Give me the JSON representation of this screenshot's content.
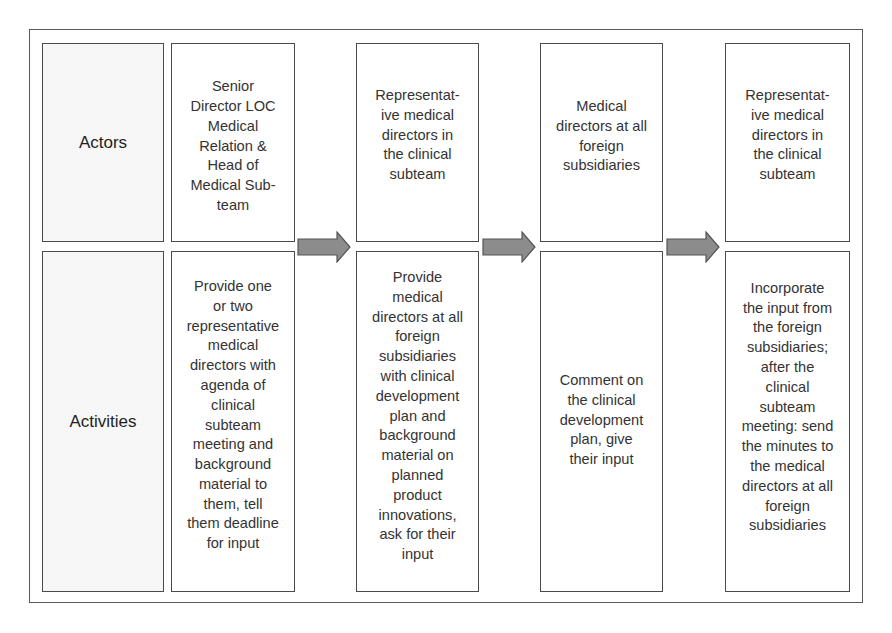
{
  "diagram": {
    "rows": {
      "actors_label": "Actors",
      "activities_label": "Activities"
    },
    "steps": [
      {
        "actor": "Senior\nDirector LOC\nMedical\nRelation &\nHead of\nMedical Sub-\nteam",
        "activity": "Provide one\nor two\nrepresentative\nmedical\ndirectors with\nagenda of\nclinical\nsubteam\nmeeting and\nbackground\nmaterial to\nthem, tell\nthem deadline\nfor input"
      },
      {
        "actor": "Representat-\nive medical\ndirectors in\nthe clinical\nsubteam",
        "activity": "Provide\nmedical\ndirectors at all\nforeign\nsubsidiaries\nwith clinical\ndevelopment\nplan and\nbackground\nmaterial on\nplanned\nproduct\ninnovations,\nask for their\ninput"
      },
      {
        "actor": "Medical\ndirectors at all\nforeign\nsubsidiaries",
        "activity": "Comment on\nthe clinical\ndevelopment\nplan, give\ntheir input"
      },
      {
        "actor": "Representat-\nive medical\ndirectors in\nthe clinical\nsubteam",
        "activity": "Incorporate\nthe input from\nthe foreign\nsubsidiaries;\nafter the\nclinical\nsubteam\nmeeting: send\nthe minutes to\nthe medical\ndirectors at all\nforeign\nsubsidiaries"
      }
    ],
    "arrows": [
      {
        "from_step": 1,
        "to_step": 2
      },
      {
        "from_step": 2,
        "to_step": 3
      },
      {
        "from_step": 3,
        "to_step": 4
      }
    ],
    "colors": {
      "border": "#4a4a4a",
      "arrow_fill": "#8c8c8c",
      "arrow_stroke": "#555555",
      "label_fill": "#f7f7f7",
      "text": "#333333"
    }
  }
}
